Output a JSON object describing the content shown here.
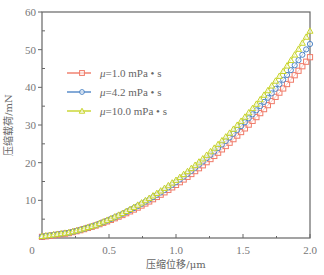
{
  "chart_data": {
    "type": "line",
    "title": "",
    "xlabel": "压缩位移/μm",
    "ylabel": "压缩载荷/mN",
    "xlim": [
      0,
      2.0
    ],
    "ylim": [
      0,
      60
    ],
    "xticks": [
      "0",
      "0.5",
      "1.0",
      "1.5",
      "2.0"
    ],
    "yticks": [
      "10",
      "20",
      "30",
      "40",
      "50",
      "60"
    ],
    "grid": false,
    "legend_position": "upper left",
    "x": [
      0,
      0.1,
      0.2,
      0.3,
      0.4,
      0.5,
      0.6,
      0.7,
      0.8,
      0.9,
      1.0,
      1.1,
      1.2,
      1.3,
      1.4,
      1.5,
      1.6,
      1.7,
      1.8,
      1.9,
      2.0
    ],
    "series": [
      {
        "name": "μ=1.0 mPa·s",
        "label_prefix": "μ=",
        "label_value": "1.0 mPa • s",
        "color": "#f07a68",
        "marker": "square",
        "values": [
          0.3,
          0.8,
          1.3,
          2.2,
          3.3,
          4.6,
          6.1,
          7.8,
          9.7,
          11.8,
          14.1,
          16.6,
          19.3,
          22.2,
          25.3,
          28.6,
          32.1,
          35.8,
          39.7,
          43.8,
          48.0
        ]
      },
      {
        "name": "μ=4.2 mPa·s",
        "label_prefix": "μ=",
        "label_value": "4.2 mPa • s",
        "color": "#4f86c6",
        "marker": "circle",
        "values": [
          0.4,
          0.9,
          1.4,
          2.3,
          3.4,
          4.8,
          6.4,
          8.2,
          10.2,
          12.4,
          14.8,
          17.4,
          20.3,
          23.4,
          26.7,
          30.2,
          33.9,
          37.8,
          42.0,
          46.5,
          51.5
        ]
      },
      {
        "name": "μ=10.0 mPa·s",
        "label_prefix": "μ=",
        "label_value": "10.0 mPa • s",
        "color": "#c8d42a",
        "marker": "triangle",
        "values": [
          0.5,
          1.0,
          1.5,
          2.4,
          3.5,
          5.0,
          6.6,
          8.5,
          10.6,
          12.9,
          15.4,
          18.1,
          21.1,
          24.4,
          27.9,
          31.6,
          35.6,
          39.8,
          44.3,
          49.4,
          55.0
        ]
      }
    ]
  },
  "axes": {
    "x_label": "压缩位移/μm",
    "y_label": "压缩载荷/mN",
    "x_zero_label": "0"
  }
}
